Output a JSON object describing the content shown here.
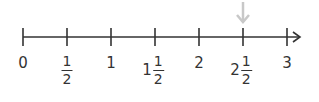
{
  "diagram": {
    "type": "number_line",
    "range": [
      0,
      3
    ],
    "step": 0.5,
    "line_color": "#333333",
    "pointer_color": "#c8c8c8",
    "pointer_at": "2 1/2",
    "labels": [
      {
        "whole": "0"
      },
      {
        "num": "1",
        "den": "2"
      },
      {
        "whole": "1"
      },
      {
        "whole": "1",
        "num": "1",
        "den": "2"
      },
      {
        "whole": "2"
      },
      {
        "whole": "2",
        "num": "1",
        "den": "2"
      },
      {
        "whole": "3"
      }
    ]
  }
}
